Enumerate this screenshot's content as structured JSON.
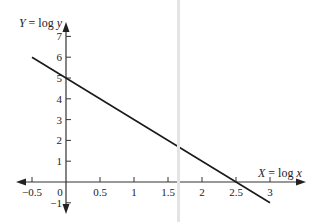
{
  "chart_data": {
    "type": "line",
    "title": "",
    "xlabel": "X = log x",
    "ylabel": "Y = log y",
    "xlabel_parts": {
      "var": "X",
      "eq": " = log ",
      "arg": "x"
    },
    "ylabel_parts": {
      "var": "Y",
      "eq": " = log ",
      "arg": "y"
    },
    "xlim": [
      -0.5,
      3
    ],
    "ylim": [
      -1,
      7
    ],
    "x_ticks": [
      -0.5,
      0,
      0.5,
      1,
      1.5,
      2,
      2.5,
      3
    ],
    "x_tick_labels": [
      "−0.5",
      "0",
      "0.5",
      "1",
      "1.5",
      "2",
      "2.5",
      "3"
    ],
    "y_ticks": [
      -1,
      1,
      2,
      3,
      4,
      5,
      6,
      7
    ],
    "y_tick_labels": [
      "−1",
      "1",
      "2",
      "3",
      "4",
      "5",
      "6",
      "7"
    ],
    "grid": false,
    "legend": null,
    "series": [
      {
        "name": "Y = 5 - 2X",
        "x": [
          -0.5,
          0,
          0.5,
          1,
          1.5,
          2,
          2.5,
          3
        ],
        "y": [
          6,
          5,
          4,
          3,
          2,
          1,
          0,
          -1
        ],
        "color": "#1a1a1a"
      }
    ]
  }
}
